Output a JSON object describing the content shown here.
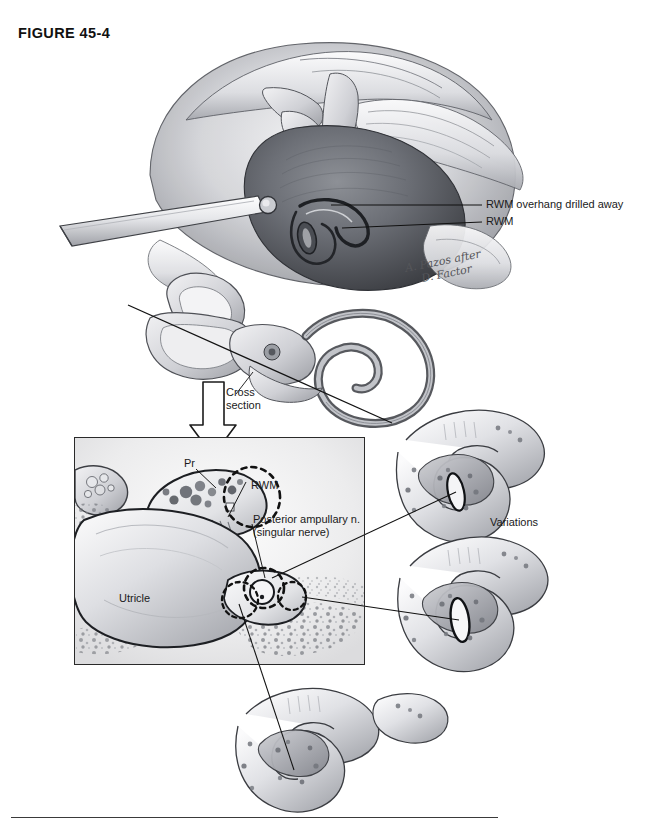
{
  "figure": {
    "label": "FIGURE 45-4",
    "domain_note": "Surgical anatomy plate: transmastoid/retrolabyrinthine approach to the posterior ampullary (singular) nerve"
  },
  "signature": {
    "line1": "A. Pazos after",
    "line2": "D. Factor"
  },
  "top_panel": {
    "callouts": [
      {
        "id": "rwm-overhang",
        "text": "RWM overhang drilled away"
      },
      {
        "id": "rwm",
        "text": "RWM"
      }
    ]
  },
  "labyrinth_panel": {
    "cross_section_label_line1": "Cross",
    "cross_section_label_line2": "section"
  },
  "inset_panel": {
    "labels": [
      {
        "id": "pr",
        "text": "Pr"
      },
      {
        "id": "rwm",
        "text": "RWM"
      },
      {
        "id": "posterior-ampullary-nerve-line1",
        "text": "Posterior ampullary n."
      },
      {
        "id": "posterior-ampullary-nerve-line2",
        "text": "(singular nerve)"
      },
      {
        "id": "utricle",
        "text": "Utricle"
      }
    ]
  },
  "variations_panel": {
    "label": "Variations",
    "count": 3
  },
  "colors": {
    "ink": "#1a1a1a",
    "frame": "#2a2a2a",
    "leader": "#111111",
    "paper": "#ffffff",
    "wash_light": "#d8d9dd",
    "wash_mid": "#a9abb1",
    "wash_dark": "#6d7076",
    "wash_deep": "#44464b",
    "signature": "#55565a"
  }
}
